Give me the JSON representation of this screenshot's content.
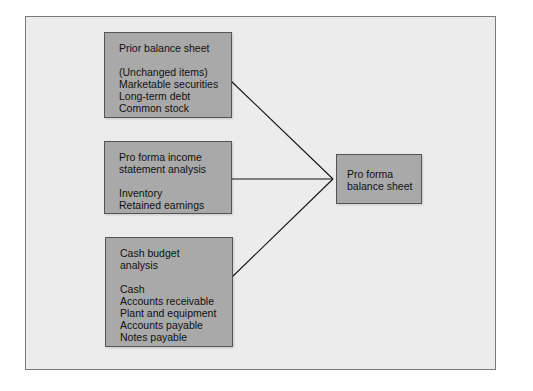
{
  "diagram": {
    "colors": {
      "background": "#ececec",
      "box_fill": "#a9a9a9",
      "line": "#111111"
    },
    "sources": [
      {
        "title_lines": [
          "Prior balance sheet"
        ],
        "items": [
          "(Unchanged items)",
          "Marketable securities",
          "Long-term debt",
          "Common stock"
        ]
      },
      {
        "title_lines": [
          "Pro forma income",
          "statement analysis"
        ],
        "items": [
          "Inventory",
          "Retained earnings"
        ]
      },
      {
        "title_lines": [
          "Cash budget",
          "analysis"
        ],
        "items": [
          "Cash",
          "Accounts receivable",
          "Plant and equipment",
          "Accounts payable",
          "Notes payable"
        ]
      }
    ],
    "target": {
      "title_lines": [
        "Pro forma",
        "balance sheet"
      ]
    }
  }
}
